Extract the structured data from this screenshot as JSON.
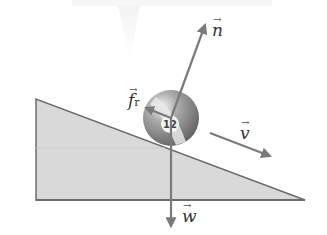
{
  "diagram": {
    "type": "free-body-diagram",
    "ball_number": "12",
    "vectors": [
      {
        "id": "n",
        "label": "n",
        "meaning": "normal force"
      },
      {
        "id": "fr",
        "label": "f",
        "subscript": "r",
        "meaning": "rolling friction"
      },
      {
        "id": "v",
        "label": "v",
        "meaning": "velocity"
      },
      {
        "id": "w",
        "label": "w",
        "meaning": "weight"
      }
    ],
    "colors": {
      "incline_fill": "#d9d9d9",
      "incline_edge": "#6b6b6b",
      "vector": "#7a7a7a",
      "ball_body": "#8a8a8a",
      "ball_stripe": "#e6e6e6",
      "label": "#333333"
    }
  }
}
